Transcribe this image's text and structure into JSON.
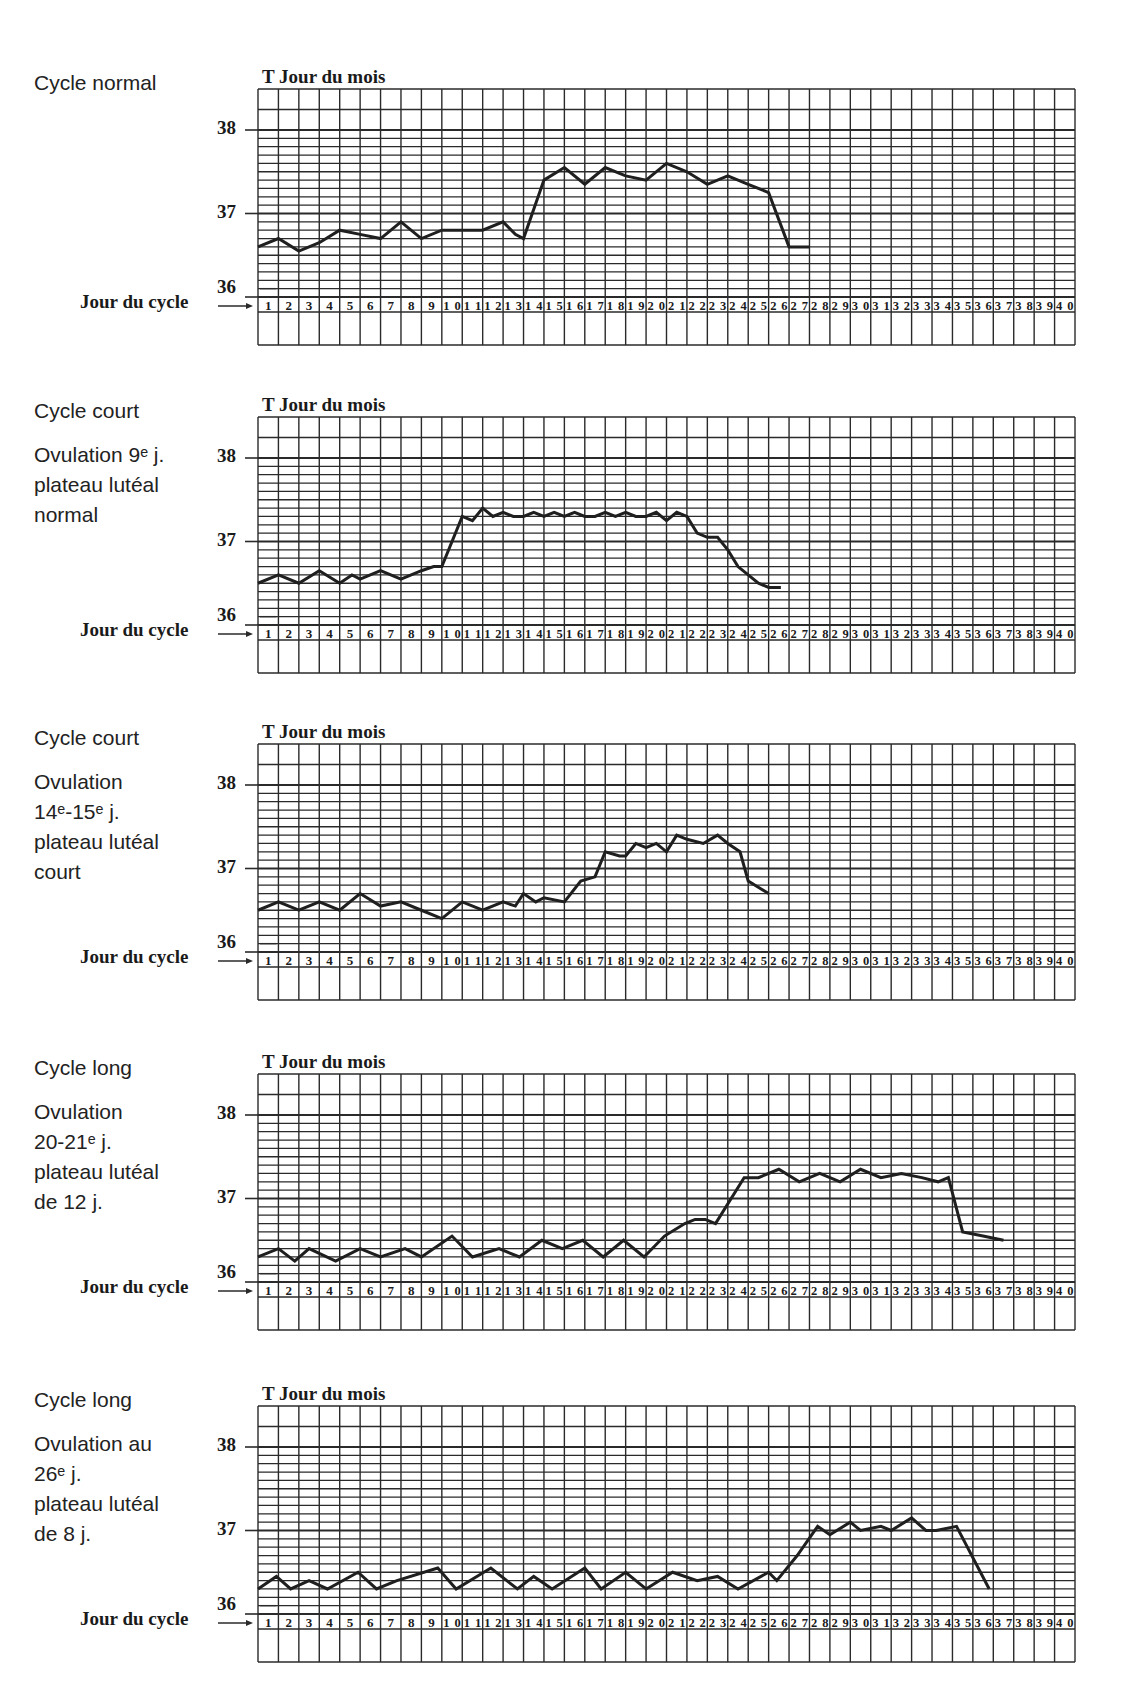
{
  "page": {
    "y_axis_label": "T",
    "x_axis_top_label": "Jour du mois",
    "x_axis_bottom_label": "Jour du cycle",
    "arrow_glyph": "→",
    "line_color": "#1f1f1f",
    "grid_color": "#2a2a2a"
  },
  "panels": [
    {
      "title": "Cycle normal",
      "lines": [],
      "chart_title": "T Jour du mois",
      "jour_cycle_label": "Jour du cycle",
      "y_ticks": [
        "38",
        "37",
        "36"
      ]
    },
    {
      "title": "Cycle court",
      "lines": [
        "Ovulation 9ᵉ j.",
        "plateau lutéal",
        "normal"
      ],
      "chart_title": "T Jour du mois",
      "jour_cycle_label": "Jour du cycle",
      "y_ticks": [
        "38",
        "37",
        "36"
      ]
    },
    {
      "title": "Cycle court",
      "lines": [
        "Ovulation",
        "14ᵉ-15ᵉ j.",
        "plateau lutéal",
        "court"
      ],
      "chart_title": "T Jour du mois",
      "jour_cycle_label": "Jour du cycle",
      "y_ticks": [
        "38",
        "37",
        "36"
      ]
    },
    {
      "title": "Cycle long",
      "lines": [
        "Ovulation",
        "20-21ᵉ j.",
        "plateau lutéal",
        "de 12 j."
      ],
      "chart_title": "T Jour du mois",
      "jour_cycle_label": "Jour du cycle",
      "y_ticks": [
        "38",
        "37",
        "36"
      ]
    },
    {
      "title": "Cycle long",
      "lines": [
        "Ovulation au",
        "26ᵉ j.",
        "plateau lutéal",
        "de 8 j."
      ],
      "chart_title": "T Jour du mois",
      "jour_cycle_label": "Jour du cycle",
      "y_ticks": [
        "38",
        "37",
        "36"
      ]
    }
  ],
  "chart_data": [
    {
      "type": "line",
      "title": "Cycle normal",
      "xlabel": "Jour du cycle",
      "ylabel": "T",
      "top_xlabel": "Jour du mois",
      "ylim": [
        36,
        38
      ],
      "y_ticks": [
        36,
        37,
        38
      ],
      "x_ticks": [
        1,
        2,
        3,
        4,
        5,
        6,
        7,
        8,
        9,
        10,
        11,
        12,
        13,
        14,
        15,
        16,
        17,
        18,
        19,
        20,
        21,
        22,
        23,
        24,
        25,
        26,
        27,
        28,
        29,
        30,
        31,
        32,
        33,
        34,
        35,
        36,
        37,
        38,
        39,
        40
      ],
      "grid": true,
      "x": [
        0.0,
        1.0,
        2.0,
        3.0,
        4.0,
        5.0,
        6.0,
        7.0,
        8.0,
        9.0,
        10.0,
        11.0,
        12.0,
        12.6,
        13.0,
        14.0,
        15.0,
        16.0,
        17.0,
        18.0,
        19.0,
        20.0,
        21.0,
        22.0,
        23.0,
        24.0,
        25.0,
        26.0,
        27.0
      ],
      "values": [
        36.6,
        36.7,
        36.55,
        36.65,
        36.8,
        36.75,
        36.7,
        36.9,
        36.7,
        36.8,
        36.8,
        36.8,
        36.9,
        36.75,
        36.7,
        37.4,
        37.55,
        37.35,
        37.55,
        37.45,
        37.4,
        37.6,
        37.5,
        37.35,
        37.45,
        37.35,
        37.25,
        36.6,
        36.6
      ]
    },
    {
      "type": "line",
      "title": "Cycle court — Ovulation 9ᵉ j., plateau lutéal normal",
      "xlabel": "Jour du cycle",
      "ylabel": "T",
      "top_xlabel": "Jour du mois",
      "ylim": [
        36,
        38
      ],
      "y_ticks": [
        36,
        37,
        38
      ],
      "x_ticks": [
        1,
        2,
        3,
        4,
        5,
        6,
        7,
        8,
        9,
        10,
        11,
        12,
        13,
        14,
        15,
        16,
        17,
        18,
        19,
        20,
        21,
        22,
        23,
        24,
        25,
        26,
        27,
        28,
        29,
        30,
        31,
        32,
        33,
        34,
        35,
        36,
        37,
        38,
        39,
        40
      ],
      "grid": true,
      "x": [
        0.0,
        1.0,
        2.0,
        3.0,
        4.0,
        4.6,
        5.0,
        6.0,
        7.0,
        8.0,
        8.6,
        9.0,
        10.0,
        10.5,
        11.0,
        11.5,
        12.0,
        12.5,
        13.0,
        13.5,
        14.0,
        14.5,
        15.0,
        15.5,
        16.0,
        16.5,
        17.0,
        17.5,
        18.0,
        18.5,
        19.0,
        19.5,
        20.0,
        20.5,
        21.0,
        21.5,
        22.0,
        22.5,
        23.0,
        23.5,
        24.0,
        24.5,
        25.0,
        25.6
      ],
      "values": [
        36.5,
        36.6,
        36.5,
        36.65,
        36.5,
        36.6,
        36.55,
        36.65,
        36.55,
        36.65,
        36.7,
        36.7,
        37.3,
        37.25,
        37.4,
        37.3,
        37.35,
        37.3,
        37.3,
        37.35,
        37.3,
        37.35,
        37.3,
        37.35,
        37.3,
        37.3,
        37.35,
        37.3,
        37.35,
        37.3,
        37.3,
        37.35,
        37.25,
        37.35,
        37.3,
        37.1,
        37.05,
        37.05,
        36.9,
        36.7,
        36.6,
        36.5,
        36.45,
        36.45
      ]
    },
    {
      "type": "line",
      "title": "Cycle court — Ovulation 14ᵉ-15ᵉ j., plateau lutéal court",
      "xlabel": "Jour du cycle",
      "ylabel": "T",
      "top_xlabel": "Jour du mois",
      "ylim": [
        36,
        38
      ],
      "y_ticks": [
        36,
        37,
        38
      ],
      "x_ticks": [
        1,
        2,
        3,
        4,
        5,
        6,
        7,
        8,
        9,
        10,
        11,
        12,
        13,
        14,
        15,
        16,
        17,
        18,
        19,
        20,
        21,
        22,
        23,
        24,
        25,
        26,
        27,
        28,
        29,
        30,
        31,
        32,
        33,
        34,
        35,
        36,
        37,
        38,
        39,
        40
      ],
      "grid": true,
      "x": [
        0.0,
        1.0,
        2.0,
        3.0,
        4.0,
        5.0,
        6.0,
        7.0,
        8.0,
        9.0,
        10.0,
        11.0,
        12.0,
        12.6,
        13.0,
        13.6,
        14.0,
        15.0,
        15.8,
        16.5,
        17.0,
        17.7,
        18.0,
        18.5,
        19.0,
        19.5,
        20.0,
        20.5,
        21.0,
        21.8,
        22.5,
        23.0,
        23.6,
        24.0,
        25.0
      ],
      "values": [
        36.5,
        36.6,
        36.5,
        36.6,
        36.5,
        36.7,
        36.55,
        36.6,
        36.5,
        36.4,
        36.6,
        36.5,
        36.6,
        36.55,
        36.7,
        36.6,
        36.65,
        36.6,
        36.85,
        36.9,
        37.2,
        37.15,
        37.15,
        37.3,
        37.25,
        37.3,
        37.2,
        37.4,
        37.35,
        37.3,
        37.4,
        37.3,
        37.2,
        36.85,
        36.7
      ]
    },
    {
      "type": "line",
      "title": "Cycle long — Ovulation 20-21ᵉ j., plateau lutéal de 12 j.",
      "xlabel": "Jour du cycle",
      "ylabel": "T",
      "top_xlabel": "Jour du mois",
      "ylim": [
        36,
        38
      ],
      "y_ticks": [
        36,
        37,
        38
      ],
      "x_ticks": [
        1,
        2,
        3,
        4,
        5,
        6,
        7,
        8,
        9,
        10,
        11,
        12,
        13,
        14,
        15,
        16,
        17,
        18,
        19,
        20,
        21,
        22,
        23,
        24,
        25,
        26,
        27,
        28,
        29,
        30,
        31,
        32,
        33,
        34,
        35,
        36,
        37,
        38,
        39,
        40
      ],
      "grid": true,
      "x": [
        0.0,
        1.0,
        1.8,
        2.5,
        3.8,
        5.0,
        6.0,
        7.2,
        8.0,
        9.5,
        10.5,
        11.8,
        12.8,
        13.9,
        14.9,
        15.9,
        16.9,
        17.9,
        18.9,
        19.9,
        20.9,
        21.4,
        21.9,
        22.4,
        23.8,
        24.5,
        25.5,
        26.5,
        27.5,
        28.5,
        29.5,
        30.5,
        31.5,
        32.5,
        33.3,
        33.8,
        34.5,
        35.5,
        36.5
      ],
      "values": [
        36.3,
        36.4,
        36.25,
        36.4,
        36.25,
        36.4,
        36.3,
        36.4,
        36.3,
        36.55,
        36.3,
        36.4,
        36.3,
        36.5,
        36.4,
        36.5,
        36.3,
        36.5,
        36.3,
        36.55,
        36.7,
        36.75,
        36.75,
        36.7,
        37.25,
        37.25,
        37.35,
        37.2,
        37.3,
        37.2,
        37.35,
        37.25,
        37.3,
        37.25,
        37.2,
        37.25,
        36.6,
        36.55,
        36.5
      ]
    },
    {
      "type": "line",
      "title": "Cycle long — Ovulation au 26ᵉ j., plateau lutéal de 8 j.",
      "xlabel": "Jour du cycle",
      "ylabel": "T",
      "top_xlabel": "Jour du mois",
      "ylim": [
        36,
        38
      ],
      "y_ticks": [
        36,
        37,
        38
      ],
      "x_ticks": [
        1,
        2,
        3,
        4,
        5,
        6,
        7,
        8,
        9,
        10,
        11,
        12,
        13,
        14,
        15,
        16,
        17,
        18,
        19,
        20,
        21,
        22,
        23,
        24,
        25,
        26,
        27,
        28,
        29,
        30,
        31,
        32,
        33,
        34,
        35,
        36,
        37,
        38,
        39,
        40
      ],
      "grid": true,
      "x": [
        0.0,
        0.9,
        1.6,
        2.5,
        3.4,
        4.9,
        5.8,
        6.8,
        8.8,
        9.7,
        11.4,
        12.7,
        13.5,
        14.4,
        16.0,
        16.8,
        18.0,
        19.0,
        20.3,
        21.5,
        22.5,
        23.5,
        25.0,
        25.4,
        26.4,
        27.4,
        28.0,
        29.0,
        29.5,
        30.5,
        31.0,
        32.0,
        32.7,
        33.2,
        34.2,
        35.8
      ],
      "values": [
        36.3,
        36.45,
        36.3,
        36.4,
        36.3,
        36.5,
        36.3,
        36.4,
        36.55,
        36.3,
        36.55,
        36.3,
        36.45,
        36.3,
        36.55,
        36.3,
        36.5,
        36.3,
        36.5,
        36.4,
        36.45,
        36.3,
        36.5,
        36.4,
        36.7,
        37.05,
        36.95,
        37.1,
        37.0,
        37.05,
        37.0,
        37.15,
        37.0,
        37.0,
        37.05,
        36.3
      ]
    }
  ]
}
